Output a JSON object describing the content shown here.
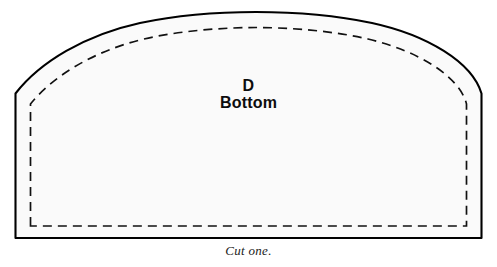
{
  "document": {
    "type": "sewing-pattern-piece",
    "background_color": "#ffffff"
  },
  "pattern_piece": {
    "letter": "D",
    "name": "Bottom",
    "instruction": "Cut one.",
    "fill_color": "#fafafa",
    "outline_color": "#000000",
    "seam_line_color": "#111111",
    "outline_style": "solid",
    "seam_line_style": "dashed",
    "shape_description": "domed arch top with near-vertical sides and flat bottom edge",
    "outline_path": "M 15.5 238 L 15.5 93.5 C 40 62 85 35 140 23 C 185 13.5 235 12 256 12 C 277 12 327 13.5 372 23 C 427 35 472 62 481.5 93.5 L 481.5 238 Z",
    "seam_path": "M 30.5 226 L 30.5 104 C 52 77 93 51 144 39 C 187 29 236 27.5 256 27.5 C 276 27.5 325 29 368 39 C 419 51 460 77 466.5 104 L 466.5 226 Z",
    "seam_dash_pattern": "9 6"
  }
}
